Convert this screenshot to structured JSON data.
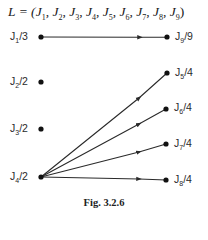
{
  "title": {
    "prefix": "L = (",
    "items": [
      "J",
      "J",
      "J",
      "J",
      "J",
      "J",
      "J",
      "J",
      "J"
    ],
    "subs": [
      "1",
      "2",
      "3",
      "4",
      "5",
      "6",
      "7",
      "8",
      "9"
    ],
    "suffix": ")"
  },
  "nodes": [
    {
      "id": "J1",
      "name": "J",
      "sub": "1",
      "weight": "/3"
    },
    {
      "id": "J2",
      "name": "J",
      "sub": "2",
      "weight": "/2"
    },
    {
      "id": "J3",
      "name": "J",
      "sub": "3",
      "weight": "/2"
    },
    {
      "id": "J4",
      "name": "J",
      "sub": "4",
      "weight": "/2"
    },
    {
      "id": "J5",
      "name": "J",
      "sub": "5",
      "weight": "/4"
    },
    {
      "id": "J6",
      "name": "J",
      "sub": "6",
      "weight": "/4"
    },
    {
      "id": "J7",
      "name": "J",
      "sub": "7",
      "weight": "/4"
    },
    {
      "id": "J8",
      "name": "J",
      "sub": "8",
      "weight": "/4"
    },
    {
      "id": "J9",
      "name": "J",
      "sub": "9",
      "weight": "/9"
    }
  ],
  "edges": [
    {
      "from": "J1",
      "to": "J9"
    },
    {
      "from": "J4",
      "to": "J5"
    },
    {
      "from": "J4",
      "to": "J6"
    },
    {
      "from": "J4",
      "to": "J7"
    },
    {
      "from": "J4",
      "to": "J8"
    }
  ],
  "caption": "Fig.  3.2.6",
  "colors": {
    "line": "#2a2a2a",
    "node": "#111111"
  }
}
